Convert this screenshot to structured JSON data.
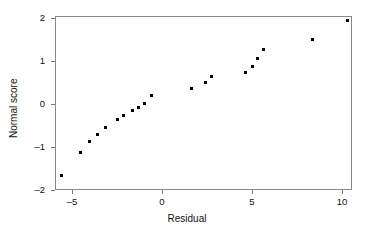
{
  "chart_data": {
    "type": "scatter",
    "title": "",
    "xlabel": "Residual",
    "ylabel": "Normal score",
    "xlim": [
      -6.5,
      10.6
    ],
    "ylim": [
      -2.05,
      2.05
    ],
    "grid": false,
    "legend": null,
    "xticks": [
      -5,
      0,
      5,
      10
    ],
    "xtick_labels": [
      "–5",
      "0",
      "5",
      "10"
    ],
    "yticks": [
      -2,
      -1,
      0,
      1,
      2
    ],
    "ytick_labels": [
      "–2",
      "–1",
      "0",
      "1",
      "2"
    ],
    "marker": "square",
    "marker_color": "#000000",
    "points": [
      {
        "x": -5.6,
        "y": -1.67
      },
      {
        "x": -4.55,
        "y": -1.13
      },
      {
        "x": -4.05,
        "y": -0.88
      },
      {
        "x": -3.6,
        "y": -0.72
      },
      {
        "x": -3.15,
        "y": -0.55
      },
      {
        "x": -2.5,
        "y": -0.37
      },
      {
        "x": -2.15,
        "y": -0.26
      },
      {
        "x": -1.65,
        "y": -0.16
      },
      {
        "x": -1.3,
        "y": -0.07
      },
      {
        "x": -0.95,
        "y": 0.02
      },
      {
        "x": -0.6,
        "y": 0.2
      },
      {
        "x": 1.65,
        "y": 0.37
      },
      {
        "x": 2.4,
        "y": 0.49
      },
      {
        "x": 2.75,
        "y": 0.63
      },
      {
        "x": 4.65,
        "y": 0.74
      },
      {
        "x": 5.0,
        "y": 0.88
      },
      {
        "x": 5.3,
        "y": 1.05
      },
      {
        "x": 5.65,
        "y": 1.26
      },
      {
        "x": 8.35,
        "y": 1.51
      },
      {
        "x": 10.3,
        "y": 1.95
      }
    ]
  },
  "axes": {
    "x_title": "Residual",
    "y_title": "Normal score"
  }
}
